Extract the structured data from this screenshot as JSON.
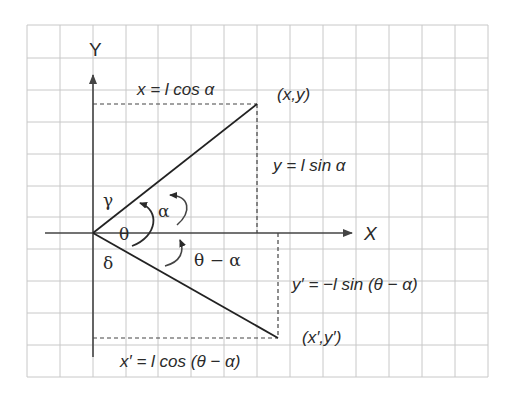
{
  "diagram": {
    "type": "coordinate-geometry",
    "grid": {
      "left": 27,
      "top": 25,
      "right": 488,
      "bottom": 377,
      "cell": 32.8,
      "color": "#c8c8c8"
    },
    "colors": {
      "ink": "#2a2a2a",
      "grid": "#c8c8c8",
      "background": "#ffffff"
    },
    "axes": {
      "x_label": "X",
      "y_label": "Y",
      "origin": [
        93,
        233
      ]
    },
    "points": {
      "upper": {
        "label": "(x,y)",
        "coords": [
          257,
          104
        ]
      },
      "lower": {
        "label": "(x′,y′)",
        "coords": [
          278,
          338
        ]
      }
    },
    "equations": {
      "x": "x = l cos α",
      "y": "y = l sin α",
      "x_prime": "x′ = l cos (θ − α)",
      "y_prime": "y′ = −l sin (θ − α)"
    },
    "angles": {
      "alpha": "α",
      "theta": "θ",
      "theta_minus_alpha": "θ − α",
      "gamma": "γ",
      "delta": "δ"
    }
  }
}
